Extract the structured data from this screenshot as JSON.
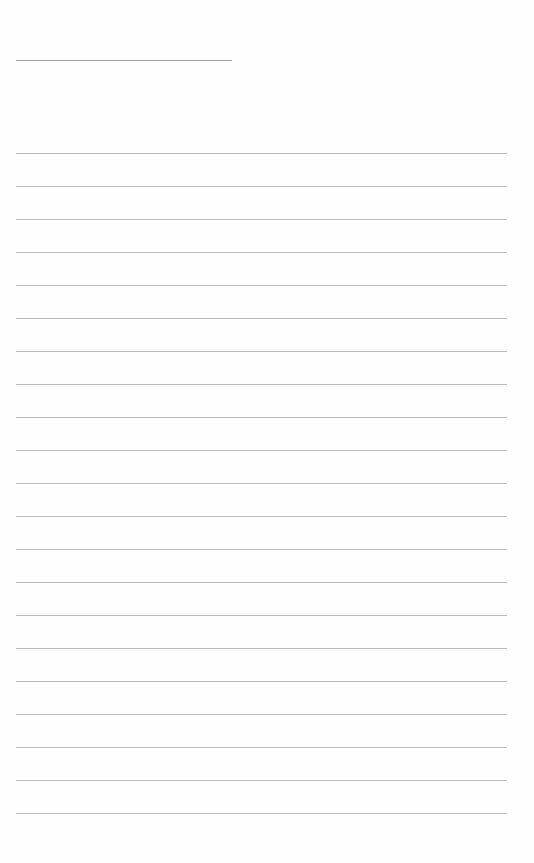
{
  "page": {
    "type": "lined-paper",
    "title_line": {
      "label": ""
    },
    "rules": [
      {
        "label": ""
      },
      {
        "label": ""
      },
      {
        "label": ""
      },
      {
        "label": ""
      },
      {
        "label": ""
      },
      {
        "label": ""
      },
      {
        "label": ""
      },
      {
        "label": ""
      },
      {
        "label": ""
      },
      {
        "label": ""
      },
      {
        "label": ""
      },
      {
        "label": ""
      },
      {
        "label": ""
      },
      {
        "label": ""
      },
      {
        "label": ""
      },
      {
        "label": ""
      },
      {
        "label": ""
      },
      {
        "label": ""
      },
      {
        "label": ""
      },
      {
        "label": ""
      },
      {
        "label": ""
      }
    ],
    "colors": {
      "background": "#fefefe",
      "title_line": "#a9a9a9",
      "rule": "#bdbdbd"
    }
  }
}
